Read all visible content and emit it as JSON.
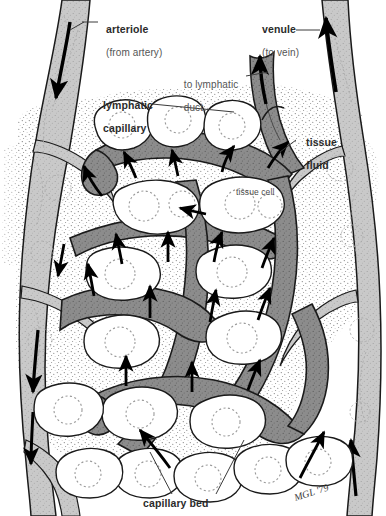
{
  "figure": {
    "title": "capillary bed",
    "signature": "MGL '79"
  },
  "labels": [
    {
      "id": "arteriole",
      "text": "arteriole",
      "sub": "(from artery)",
      "style": "bold",
      "x": 100,
      "y": 12
    },
    {
      "id": "venule",
      "text": "venule",
      "sub": "(to vein)",
      "style": "bold",
      "x": 256,
      "y": 12
    },
    {
      "id": "lymphatic-duct",
      "text": "to lymphatic",
      "sub": "duct",
      "style": "light",
      "x": 178,
      "y": 68
    },
    {
      "id": "lymphatic-capillary",
      "text": "lymphatic",
      "sub": "capillary",
      "style": "bold",
      "x": 97,
      "y": 88
    },
    {
      "id": "tissue-fluid",
      "text": "tissue",
      "sub": "fluid",
      "style": "bold",
      "x": 300,
      "y": 125
    },
    {
      "id": "tissue-cell",
      "text": "tissue cell",
      "sub": "",
      "style": "tiny",
      "x": 236,
      "y": 188
    },
    {
      "id": "capillary-bed",
      "text": "capillary bed",
      "sub": "",
      "style": "bold",
      "x": 143,
      "y": 498
    }
  ],
  "colors": {
    "background": "#ffffff",
    "vessel_light": "#c9c9c9",
    "vessel_light_edge": "#b3b3b3",
    "lymphatic_dark": "#8c8c8c",
    "lymphatic_dark_edge": "#757575",
    "cell_fill": "#ffffff",
    "nucleus_stroke": "#9a9a9a",
    "outline": "#1a1a1a",
    "arrow": "#000000",
    "stipple": "#6e6e6e",
    "label_text": "#2b2b2b",
    "label_light_text": "#555555"
  },
  "structures": {
    "arteriole": "left light-gray vessel descending from top-left, black arrow flowing downward",
    "venule": "right light-gray vessel ascending to top-right, black arrow flowing upward",
    "lymphatic_capillary": "dark-gray blind-ended network in the centre draining to lymphatic duct",
    "tissue_cells": "white rounded polygonal cells with dotted circular nuclei",
    "tissue_fluid": "stippled dotted regions between cells and vessels",
    "flow_arrows": "black arrows showing tissue fluid entering lymphatic capillaries"
  }
}
